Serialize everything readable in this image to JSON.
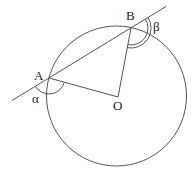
{
  "diagram": {
    "type": "circle-geometry",
    "circle": {
      "center": "O",
      "cx": 116.5,
      "cy": 96,
      "r": 70
    },
    "points": {
      "A": {
        "label": "A",
        "x": 49,
        "y": 78
      },
      "B": {
        "label": "B",
        "x": 131,
        "y": 28
      },
      "O": {
        "label": "O",
        "x": 118,
        "y": 97
      }
    },
    "line_AB_extended": {
      "x1": 12,
      "y1": 100.5,
      "x2": 166,
      "y2": 6.5
    },
    "segments": [
      {
        "from": "A",
        "to": "O"
      },
      {
        "from": "B",
        "to": "O"
      }
    ],
    "angles": {
      "alpha": {
        "symbol": "α",
        "vertex": "A",
        "arcs": 1
      },
      "beta": {
        "symbol": "β",
        "vertex": "B",
        "arcs": 2
      }
    },
    "labels": {
      "A": "A",
      "B": "B",
      "O": "O",
      "alpha": "α",
      "beta": "β"
    },
    "stroke_color": "#555555",
    "text_color": "#222222"
  }
}
